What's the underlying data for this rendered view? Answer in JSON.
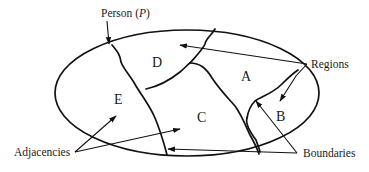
{
  "diagram": {
    "type": "territory-map",
    "regions": [
      {
        "id": "A",
        "label": "A"
      },
      {
        "id": "B",
        "label": "B"
      },
      {
        "id": "C",
        "label": "C"
      },
      {
        "id": "D",
        "label": "D"
      },
      {
        "id": "E",
        "label": "E"
      }
    ],
    "callouts": {
      "person": {
        "label": "Person (",
        "var": "P",
        "close": ")"
      },
      "regions": {
        "label": "Regions"
      },
      "adjacencies": {
        "label": "Adjacencies"
      },
      "boundaries": {
        "label": "Boundaries"
      }
    },
    "colors": {
      "ink": "#111111",
      "background": "#ffffff"
    }
  }
}
